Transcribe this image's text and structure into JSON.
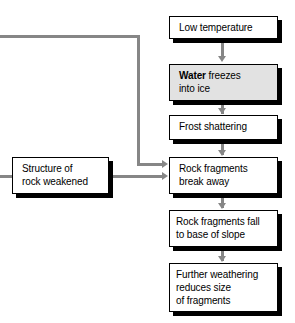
{
  "diagram": {
    "colors": {
      "box_fill": "#ffffff",
      "highlight_fill": "#e2e2e2",
      "border": "#000000",
      "shadow": "#000000",
      "connector": "#868686"
    },
    "nodes": [
      {
        "id": "low-temperature",
        "label": "Low temperature",
        "lines": [
          "Low temperature"
        ],
        "highlighted": false
      },
      {
        "id": "water-freezes",
        "label": "Water freezes into ice",
        "lines": [
          "Water freezes",
          "into ice"
        ],
        "bold_word": "Water",
        "rest_line1": " freezes",
        "highlighted": true
      },
      {
        "id": "frost-shattering",
        "label": "Frost shattering",
        "lines": [
          "Frost shattering"
        ],
        "highlighted": false
      },
      {
        "id": "rock-fragments-break-away",
        "label": "Rock fragments break away",
        "lines": [
          "Rock fragments",
          "break away"
        ],
        "highlighted": false
      },
      {
        "id": "rock-fragments-fall",
        "label": "Rock fragments fall to base of slope",
        "lines": [
          "Rock fragments fall",
          "to base of slope"
        ],
        "highlighted": false
      },
      {
        "id": "further-weathering",
        "label": "Further weathering reduces size of fragments",
        "lines": [
          "Further weathering",
          "reduces size",
          "of fragments"
        ],
        "highlighted": false
      },
      {
        "id": "structure-weakened",
        "label": "Structure of rock weakened",
        "lines": [
          "Structure of",
          "rock weakened"
        ],
        "highlighted": false
      }
    ],
    "edges": [
      {
        "from": "low-temperature",
        "to": "water-freezes",
        "style": "arrow-down"
      },
      {
        "from": "water-freezes",
        "to": "frost-shattering",
        "style": "arrow-down"
      },
      {
        "from": "frost-shattering",
        "to": "rock-fragments-break-away",
        "style": "arrow-down"
      },
      {
        "from": "rock-fragments-break-away",
        "to": "rock-fragments-fall",
        "style": "arrow-down"
      },
      {
        "from": "rock-fragments-fall",
        "to": "further-weathering",
        "style": "arrow-down"
      },
      {
        "from": "structure-weakened",
        "to": "rock-fragments-break-away",
        "style": "arrow-right"
      },
      {
        "from": "feedback-offpage",
        "to": "rock-fragments-break-away",
        "style": "elbow-arrow-right"
      },
      {
        "from": "offpage-left",
        "to": "structure-weakened",
        "style": "line"
      }
    ]
  }
}
